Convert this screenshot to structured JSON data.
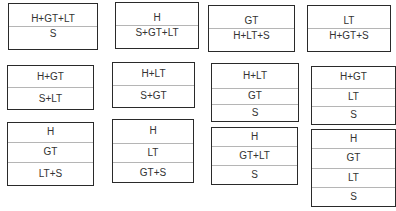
{
  "diagram": {
    "boxes": [
      {
        "id": "r1c1",
        "rows": [
          "H+GT+LT",
          "S"
        ]
      },
      {
        "id": "r1c2",
        "rows": [
          "H",
          "S+GT+LT"
        ]
      },
      {
        "id": "r1c3",
        "rows": [
          "GT",
          "H+LT+S"
        ]
      },
      {
        "id": "r1c4",
        "rows": [
          "LT",
          "H+GT+S"
        ]
      },
      {
        "id": "r2c1",
        "rows": [
          "H+GT",
          "S+LT"
        ]
      },
      {
        "id": "r2c2",
        "rows": [
          "H+LT",
          "S+GT"
        ]
      },
      {
        "id": "r2c3",
        "rows": [
          "H+LT",
          "GT",
          "S"
        ]
      },
      {
        "id": "r2c4",
        "rows": [
          "H+GT",
          "LT",
          "S"
        ]
      },
      {
        "id": "r3c1",
        "rows": [
          "H",
          "GT",
          "LT+S"
        ]
      },
      {
        "id": "r3c2",
        "rows": [
          "H",
          "LT",
          "GT+S"
        ]
      },
      {
        "id": "r3c3",
        "rows": [
          "H",
          "GT+LT",
          "S"
        ]
      },
      {
        "id": "r3c4",
        "rows": [
          "H",
          "GT",
          "LT",
          "S"
        ]
      }
    ]
  }
}
